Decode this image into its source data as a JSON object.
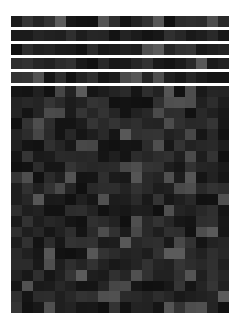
{
  "mosaic": {
    "strip_rows": 5,
    "strip_cols": 20,
    "grid_rows": 21,
    "grid_cols": 20,
    "gray_min": 16,
    "gray_max": 92,
    "seed": 7,
    "highlight_prob": 0.12
  }
}
